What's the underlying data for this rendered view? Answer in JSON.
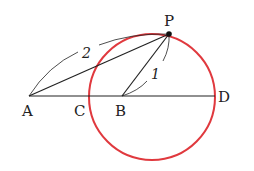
{
  "diagram": {
    "points": {
      "A": {
        "label": "A",
        "x": 29,
        "y": 96
      },
      "C": {
        "label": "C",
        "x": 90,
        "y": 96
      },
      "B": {
        "label": "B",
        "x": 122,
        "y": 96
      },
      "D": {
        "label": "D",
        "x": 215,
        "y": 96
      },
      "P": {
        "label": "P",
        "x": 169,
        "y": 34
      }
    },
    "lengths": {
      "AP": "2",
      "BP": "1"
    },
    "circle": {
      "cx": 152,
      "cy": 97,
      "r": 63,
      "color": "#e0393e"
    },
    "line_color": "#222222"
  }
}
